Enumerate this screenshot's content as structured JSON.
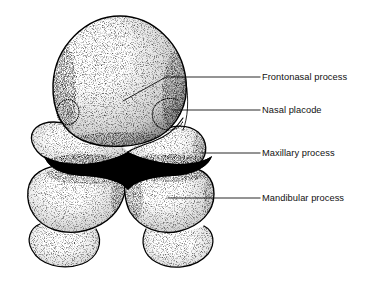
{
  "figure": {
    "title": "Embryonic face: frontal view of developing facial processes",
    "style": "stippled pen-and-ink anatomical illustration",
    "background_color": "#ffffff",
    "ink_color": "#000000",
    "text_color": "#111111"
  },
  "labels": [
    {
      "id": "frontonasal-process",
      "text": "Frontonasal process",
      "text_x": 262,
      "text_y": 80,
      "leader": {
        "kind": "bent",
        "points": "123,101 166,77 260,77"
      }
    },
    {
      "id": "nasal-placode",
      "text": "Nasal placode",
      "text_x": 262,
      "text_y": 113,
      "leader": {
        "kind": "straight",
        "points": "172,110 260,110"
      }
    },
    {
      "id": "maxillary-process",
      "text": "Maxillary process",
      "text_x": 262,
      "text_y": 156,
      "leader": {
        "kind": "straight",
        "points": "200,153 260,153"
      }
    },
    {
      "id": "mandibular-process",
      "text": "Mandibular process",
      "text_x": 262,
      "text_y": 201,
      "leader": {
        "kind": "straight",
        "points": "168,198 260,198"
      }
    }
  ],
  "structures": [
    {
      "id": "frontonasal-prominence",
      "name": "Frontonasal prominence (dome)"
    },
    {
      "id": "nasal-placode-left",
      "name": "Left nasal placode"
    },
    {
      "id": "nasal-placode-right",
      "name": "Right nasal placode"
    },
    {
      "id": "maxillary-process-left",
      "name": "Left maxillary process"
    },
    {
      "id": "maxillary-process-right",
      "name": "Right maxillary process"
    },
    {
      "id": "stomodeum",
      "name": "Stomodeum (primitive mouth)"
    },
    {
      "id": "mandibular-process-left",
      "name": "Left mandibular process"
    },
    {
      "id": "mandibular-process-right",
      "name": "Right mandibular process"
    },
    {
      "id": "pharyngeal-arch-left",
      "name": "Left lower arch bulge"
    },
    {
      "id": "pharyngeal-arch-right",
      "name": "Right lower arch bulge"
    }
  ]
}
